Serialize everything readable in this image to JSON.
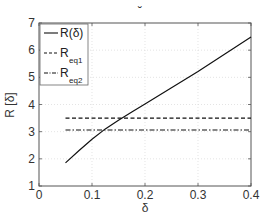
{
  "chart_data": {
    "type": "line",
    "title": "˘",
    "xlabel": "δ",
    "ylabel": "R [δ]",
    "xlim": [
      0,
      0.4
    ],
    "ylim": [
      1,
      7
    ],
    "xticks": [
      0,
      0.1,
      0.2,
      0.3,
      0.4
    ],
    "xtick_labels": [
      "0",
      "0.1",
      "0.2",
      "0.3",
      "0.4"
    ],
    "yticks": [
      1,
      2,
      3,
      4,
      5,
      6,
      7
    ],
    "ytick_labels": [
      "1",
      "2",
      "3",
      "4",
      "5",
      "6",
      "7"
    ],
    "grid": true,
    "legend_position": "upper left",
    "series": [
      {
        "name": "R(δ)",
        "legend_main": "R(δ)",
        "legend_sub": "",
        "style": "solid",
        "x": [
          0.05,
          0.075,
          0.1,
          0.125,
          0.15,
          0.175,
          0.2,
          0.25,
          0.3,
          0.35,
          0.4
        ],
        "y": [
          1.85,
          2.3,
          2.72,
          3.1,
          3.42,
          3.72,
          4.02,
          4.62,
          5.22,
          5.85,
          6.48
        ]
      },
      {
        "name": "R_eq1",
        "legend_main": "R",
        "legend_sub": "eq1",
        "style": "dashed",
        "x": [
          0.05,
          0.4
        ],
        "y": [
          3.5,
          3.5
        ]
      },
      {
        "name": "R_eq2",
        "legend_main": "R",
        "legend_sub": "eq2",
        "style": "dashdot",
        "x": [
          0.05,
          0.4
        ],
        "y": [
          3.06,
          3.06
        ]
      }
    ]
  }
}
